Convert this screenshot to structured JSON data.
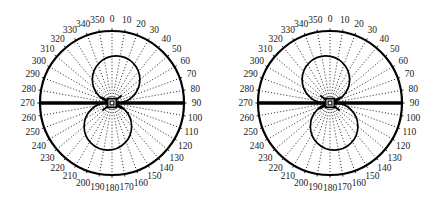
{
  "figure": {
    "title": "",
    "background_color": "#ffffff",
    "line_color": "#000000",
    "label_color": "#1a1a1a",
    "panel_count": 2
  },
  "chart_data": {
    "type": "line",
    "subtype": "polar-antenna-radiation-pattern",
    "title": "",
    "xlabel": "",
    "ylabel": "",
    "grid": true,
    "legend_position": "none",
    "angle_unit": "degrees",
    "angle_direction": "clockwise",
    "angle_zero_at": "top",
    "angle_ticks": [
      0,
      10,
      20,
      30,
      40,
      50,
      60,
      70,
      80,
      90,
      100,
      110,
      120,
      130,
      140,
      150,
      160,
      170,
      180,
      190,
      200,
      210,
      220,
      230,
      240,
      250,
      260,
      270,
      280,
      290,
      300,
      310,
      320,
      330,
      340,
      350
    ],
    "tick_labels": [
      "0",
      "10",
      "20",
      "30",
      "40",
      "50",
      "60",
      "70",
      "80",
      "90",
      "100",
      "110",
      "120",
      "130",
      "140",
      "150",
      "160",
      "170",
      "180",
      "190",
      "200",
      "210",
      "220",
      "230",
      "240",
      "250",
      "260",
      "270",
      "280",
      "290",
      "300",
      "310",
      "320",
      "330",
      "340",
      "350"
    ],
    "radial_range": [
      0,
      1
    ],
    "panels": [
      {
        "name": "left-polar-plot",
        "caption": "",
        "outer_circle_radius": 1.0,
        "series": [
          {
            "name": "main-lobe-pattern",
            "style": "solid",
            "pattern": "figure-eight",
            "lobe_radius": 0.33,
            "upper_lobe_center": {
              "angle": 10,
              "radius": 0.33
            },
            "lower_lobe_center": {
              "angle": 190,
              "radius": 0.33
            },
            "values": [
              0.33,
              0.33,
              0.32,
              0.3,
              0.27,
              0.23,
              0.18,
              0.12,
              0.06,
              0.01,
              0.06,
              0.12,
              0.18,
              0.23,
              0.27,
              0.3,
              0.32,
              0.33,
              0.33,
              0.33,
              0.32,
              0.3,
              0.27,
              0.23,
              0.18,
              0.12,
              0.06,
              0.01,
              0.06,
              0.12,
              0.18,
              0.23,
              0.27,
              0.3,
              0.32,
              0.33
            ]
          },
          {
            "name": "horizontal-axis-trace",
            "style": "thick-solid",
            "angles": [
              90,
              270
            ],
            "radius": 1.0
          },
          {
            "name": "center-marker-square",
            "style": "square-outline",
            "radius": 0.06
          },
          {
            "name": "center-spikes",
            "style": "thick-solid",
            "spike_angles": [
              52,
              118,
              232,
              298
            ],
            "spike_radius": 0.17
          }
        ]
      },
      {
        "name": "right-polar-plot",
        "caption": "",
        "outer_circle_radius": 1.0,
        "series": [
          {
            "name": "main-lobe-pattern",
            "style": "solid",
            "pattern": "figure-eight",
            "lobe_radius": 0.33,
            "upper_lobe_center": {
              "angle": 350,
              "radius": 0.33
            },
            "lower_lobe_center": {
              "angle": 170,
              "radius": 0.33
            },
            "values": [
              0.33,
              0.32,
              0.3,
              0.27,
              0.23,
              0.18,
              0.12,
              0.06,
              0.01,
              0.06,
              0.12,
              0.18,
              0.23,
              0.27,
              0.3,
              0.32,
              0.33,
              0.33,
              0.33,
              0.32,
              0.3,
              0.27,
              0.23,
              0.18,
              0.12,
              0.06,
              0.01,
              0.06,
              0.12,
              0.18,
              0.23,
              0.27,
              0.3,
              0.32,
              0.33,
              0.33
            ]
          },
          {
            "name": "horizontal-axis-trace",
            "style": "thick-solid",
            "angles": [
              90,
              270
            ],
            "radius": 1.0
          },
          {
            "name": "center-marker-square",
            "style": "square-outline",
            "radius": 0.06
          },
          {
            "name": "center-spikes",
            "style": "thick-solid",
            "spike_angles": [
              62,
              128,
              242,
              308
            ],
            "spike_radius": 0.17
          }
        ]
      }
    ]
  }
}
